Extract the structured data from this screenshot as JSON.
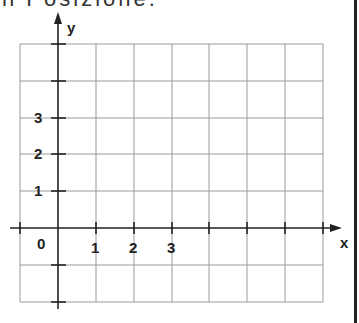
{
  "header": {
    "cropped_text": "n Posizione."
  },
  "diagram": {
    "type": "coordinate-grid",
    "x_axis_label": "x",
    "y_axis_label": "y",
    "origin_label": "0",
    "x_tick_labels": [
      "1",
      "2",
      "3"
    ],
    "y_tick_labels": [
      "1",
      "2",
      "3"
    ],
    "grid": {
      "columns": 8,
      "rows": 7,
      "x_range": [
        -1,
        7
      ],
      "y_range": [
        -2,
        5
      ]
    },
    "colors": {
      "grid": "#9a9a9a",
      "axis": "#222222",
      "border": "#222222"
    }
  }
}
